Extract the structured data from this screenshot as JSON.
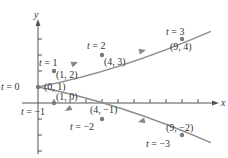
{
  "chart_data": {
    "type": "line",
    "title": "",
    "xlabel": "x",
    "ylabel": "y",
    "points": [
      {
        "t": -3,
        "x": 9,
        "y": -2,
        "t_label": "t = −3",
        "coord_label": "(9, −2)"
      },
      {
        "t": -2,
        "x": 4,
        "y": -1,
        "t_label": "t = −2",
        "coord_label": "(4, −1)"
      },
      {
        "t": -1,
        "x": 1,
        "y": 0,
        "t_label": "t = −1",
        "coord_label": "(1, 0)"
      },
      {
        "t": 0,
        "x": 0,
        "y": 1,
        "t_label": "t = 0",
        "coord_label": "(0, 1)"
      },
      {
        "t": 1,
        "x": 1,
        "y": 2,
        "t_label": "t = 1",
        "coord_label": "(1, 2)"
      },
      {
        "t": 2,
        "x": 4,
        "y": 3,
        "t_label": "t = 2",
        "coord_label": "(4, 3)"
      },
      {
        "t": 3,
        "x": 9,
        "y": 4,
        "t_label": "t = 3",
        "coord_label": "(9, 4)"
      }
    ],
    "xlim": [
      -1,
      11
    ],
    "ylim": [
      -3,
      5
    ],
    "grid": false,
    "colors": {
      "curve": "#888888",
      "points": "#777777",
      "axes": "#555555",
      "text": "#333333"
    }
  },
  "labels": {
    "x_axis": "x",
    "y_axis": "y",
    "t_neg3": "t = −3",
    "t_neg2": "t = −2",
    "t_neg1": "t = −1",
    "t_0": "t = 0",
    "t_1": "t = 1",
    "t_2": "t = 2",
    "t_3": "t = 3",
    "p_9_neg2": "(9, −2)",
    "p_4_neg1": "(4, −1)",
    "p_1_0": "(1, 0)",
    "p_0_1": "(0, 1)",
    "p_1_2": "(1, 2)",
    "p_4_3": "(4, 3)",
    "p_9_4": "(9, 4)"
  }
}
